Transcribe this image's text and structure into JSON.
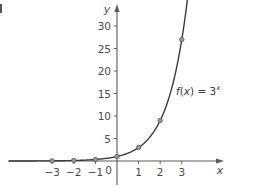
{
  "chart_data": {
    "type": "line",
    "title": "",
    "function_label": {
      "f": "f",
      "open": "(",
      "x": "x",
      "close": ")",
      "eq": " = 3",
      "exp": "x"
    },
    "xlabel": "x",
    "ylabel": "y",
    "xlim": [
      -5,
      5
    ],
    "ylim": [
      -5,
      35
    ],
    "x_ticks": [
      -3,
      -2,
      -1,
      1,
      2,
      3
    ],
    "x_tick_labels": [
      "−3",
      "−2",
      "−1",
      "1",
      "2",
      "3"
    ],
    "origin_label": "0",
    "y_ticks": [
      5,
      10,
      15,
      20,
      25,
      30
    ],
    "y_tick_labels": [
      "5",
      "10",
      "15",
      "20",
      "25",
      "30"
    ],
    "grid": false,
    "series": [
      {
        "name": "f(x) = 3^x",
        "x": [
          -3,
          -2,
          -1,
          0,
          1,
          2,
          3
        ],
        "y": [
          0.037,
          0.111,
          0.333,
          1,
          3,
          9,
          27
        ],
        "markers": true,
        "color": "#3a3a3a"
      }
    ]
  },
  "colors": {
    "axis": "#5a5a5a",
    "curve": "#3a3a3a",
    "marker_fill": "#9a9a9a",
    "marker_stroke": "#555555",
    "text": "#4a4a4a"
  },
  "layout": {
    "origin_px": [
      117,
      161
    ],
    "x_unit_px": 21.6,
    "y_unit_px": 4.5
  }
}
